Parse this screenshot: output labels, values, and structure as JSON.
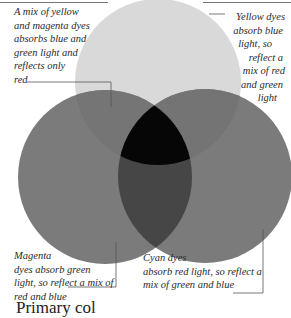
{
  "diagram": {
    "type": "subtractive-color-venn",
    "circles": [
      {
        "name": "yellow",
        "fill": "#d9d9d9"
      },
      {
        "name": "magenta",
        "fill": "#7b7b7b"
      },
      {
        "name": "cyan",
        "fill": "#7b7b7b"
      }
    ],
    "overlap_colors": {
      "yellow_magenta": "#757575",
      "yellow_cyan": "#747474",
      "magenta_cyan": "#464646",
      "all_three": "#060606"
    },
    "line_color": "#555555"
  },
  "labels": {
    "red": [
      "A mix of yellow",
      "and magenta dyes",
      "absorbs blue and",
      "green light and",
      "reflects only",
      "red"
    ],
    "yellow": [
      "Yellow dyes",
      "absorb blue",
      "light, so",
      "reflect a",
      "mix of red",
      "and green",
      "light"
    ],
    "magenta": [
      "Magenta",
      "dyes absorb green",
      "light, so reflect a mix of",
      "red and blue"
    ],
    "cyan": [
      "Cyan dyes",
      "absorb red light, so reflect a",
      "mix of green and blue"
    ]
  },
  "caption": "Primary col"
}
